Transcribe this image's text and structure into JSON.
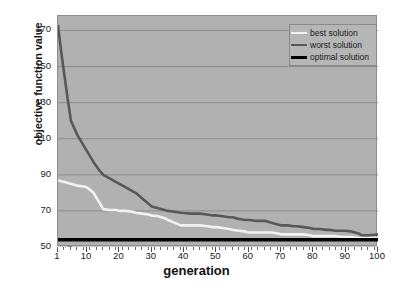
{
  "chart_data": {
    "type": "line",
    "title": "",
    "xlabel": "generation",
    "ylabel": "objective function value",
    "xlim": [
      1,
      100
    ],
    "ylim": [
      50,
      178
    ],
    "grid": true,
    "legend_position": "top-right",
    "y_ticks": [
      170,
      150,
      130,
      110,
      90,
      70,
      50
    ],
    "x_ticks": [
      1,
      10,
      20,
      30,
      40,
      50,
      60,
      70,
      80,
      90,
      100
    ],
    "x": [
      1,
      2,
      3,
      4,
      5,
      7,
      9,
      10,
      12,
      14,
      15,
      17,
      19,
      20,
      22,
      24,
      25,
      27,
      29,
      30,
      32,
      34,
      35,
      37,
      39,
      40,
      42,
      44,
      45,
      47,
      49,
      50,
      52,
      54,
      55,
      57,
      59,
      60,
      62,
      64,
      65,
      67,
      69,
      70,
      72,
      74,
      75,
      77,
      79,
      80,
      82,
      84,
      85,
      87,
      89,
      90,
      92,
      94,
      95,
      97,
      99,
      100
    ],
    "series": [
      {
        "name": "best solution",
        "color": "#f2f2f2",
        "values": [
          87,
          86.5,
          86,
          85.5,
          85,
          84,
          83.5,
          83,
          80,
          74,
          71,
          70.5,
          70.5,
          70,
          70,
          69.5,
          69,
          68.5,
          68,
          67.5,
          67,
          66,
          65,
          63.5,
          62,
          62,
          62,
          62,
          62,
          61.5,
          61,
          61,
          60.5,
          60,
          59.5,
          59,
          58.5,
          58,
          58,
          58,
          58,
          58,
          57.5,
          57,
          57,
          57,
          57,
          57,
          56.5,
          56,
          56,
          56,
          56,
          56,
          55.5,
          55.5,
          55.5,
          55,
          55,
          55,
          55,
          55
        ]
      },
      {
        "name": "worst solution",
        "color": "#585858",
        "values": [
          173,
          158,
          145,
          132,
          120,
          112,
          106,
          103,
          97,
          92,
          90,
          88,
          86,
          85,
          83,
          81,
          80,
          77,
          74,
          72.5,
          71.5,
          70.5,
          70,
          69.5,
          69,
          68.8,
          68.5,
          68.5,
          68.5,
          68,
          67.5,
          67.5,
          67,
          66.5,
          66.5,
          65.5,
          65,
          65,
          64.5,
          64.5,
          64.5,
          63.5,
          62.5,
          62,
          62,
          61.5,
          61.5,
          61,
          60.5,
          60,
          60,
          59.5,
          59.5,
          59,
          59,
          59,
          58.5,
          57.5,
          56.5,
          56.5,
          56.8,
          57
        ]
      },
      {
        "name": "optimal solution",
        "color": "#000000",
        "constant_value": 54,
        "values": [
          54,
          54,
          54,
          54,
          54,
          54,
          54,
          54,
          54,
          54,
          54,
          54,
          54,
          54,
          54,
          54,
          54,
          54,
          54,
          54,
          54,
          54,
          54,
          54,
          54,
          54,
          54,
          54,
          54,
          54,
          54,
          54,
          54,
          54,
          54,
          54,
          54,
          54,
          54,
          54,
          54,
          54,
          54,
          54,
          54,
          54,
          54,
          54,
          54,
          54,
          54,
          54,
          54,
          54,
          54,
          54,
          54,
          54,
          54,
          54,
          54,
          54
        ]
      }
    ]
  },
  "axes": {
    "y_title": "objective function value",
    "x_title": "generation",
    "y_tick_labels": [
      "170",
      "150",
      "130",
      "110",
      "90",
      "70",
      "50"
    ],
    "x_tick_labels": [
      "1",
      "10",
      "20",
      "30",
      "40",
      "50",
      "60",
      "70",
      "80",
      "90",
      "100"
    ]
  },
  "legend": {
    "items": [
      {
        "label": "best solution",
        "color": "#f2f2f2"
      },
      {
        "label": "worst solution",
        "color": "#585858"
      },
      {
        "label": "optimal solution",
        "color": "#000000"
      }
    ]
  },
  "colors": {
    "plot_background": "#b1b1b1",
    "page_background": "#ffffff",
    "gridline": "#8d8d8d",
    "text": "#1a1a1a"
  }
}
